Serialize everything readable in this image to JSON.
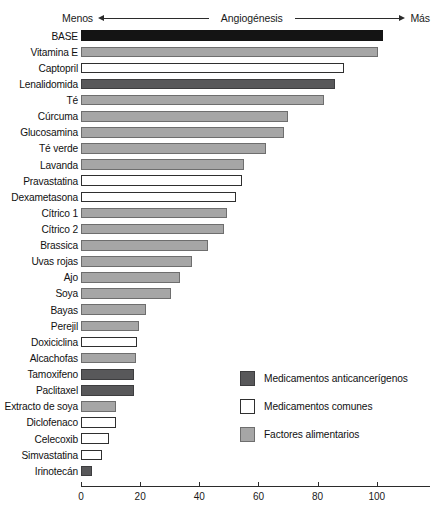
{
  "header": {
    "left_label": "Menos",
    "center_label": "Angiogénesis",
    "right_label": "Más",
    "left_arrow_icon": "arrow-left-icon",
    "right_arrow_icon": "arrow-right-icon"
  },
  "legend": {
    "position": "inside-right-lower",
    "items": [
      {
        "label": "Medicamentos anticancerígenos",
        "category": "anticancer",
        "color": "#58585a"
      },
      {
        "label": "Medicamentos comunes",
        "category": "common",
        "color": "#ffffff"
      },
      {
        "label": "Factores alimentarios",
        "category": "food",
        "color": "#a6a6a6"
      }
    ]
  },
  "chart_data": {
    "type": "bar",
    "orientation": "horizontal",
    "title": "Angiogénesis",
    "xlabel": "",
    "ylabel": "",
    "xlim": [
      0,
      118
    ],
    "ticks": [
      0,
      20,
      40,
      60,
      80,
      100
    ],
    "grid": false,
    "categories": [
      "BASE",
      "Vitamina E",
      "Captopril",
      "Lenalidomida",
      "Té",
      "Cúrcuma",
      "Glucosamina",
      "Té verde",
      "Lavanda",
      "Pravastatina",
      "Dexametasona",
      "Cítrico 1",
      "Cítrico 2",
      "Brassica",
      "Uvas rojas",
      "Ajo",
      "Soya",
      "Bayas",
      "Perejil",
      "Doxiciclina",
      "Alcachofas",
      "Tamoxifeno",
      "Paclitaxel",
      "Extracto de soya",
      "Diclofenaco",
      "Celecoxib",
      "Simvastatina",
      "Irinotecán"
    ],
    "values": [
      102,
      100.5,
      89,
      86,
      82,
      70,
      68.5,
      62.5,
      55,
      54.5,
      52.5,
      49.5,
      48.5,
      43,
      37.5,
      33.5,
      30.5,
      22,
      19.5,
      19,
      18.5,
      18,
      18,
      12,
      11.8,
      9.5,
      7,
      3.7
    ],
    "bar_categories": [
      "base",
      "food",
      "common",
      "anticancer",
      "food",
      "food",
      "food",
      "food",
      "food",
      "common",
      "common",
      "food",
      "food",
      "food",
      "food",
      "food",
      "food",
      "food",
      "food",
      "common",
      "food",
      "anticancer",
      "anticancer",
      "food",
      "common",
      "common",
      "common",
      "anticancer"
    ],
    "series": [
      {
        "name": "Angiogénesis",
        "values": [
          102,
          100.5,
          89,
          86,
          82,
          70,
          68.5,
          62.5,
          55,
          54.5,
          52.5,
          49.5,
          48.5,
          43,
          37.5,
          33.5,
          30.5,
          22,
          19.5,
          19,
          18.5,
          18,
          18,
          12,
          11.8,
          9.5,
          7,
          3.7
        ]
      }
    ]
  }
}
